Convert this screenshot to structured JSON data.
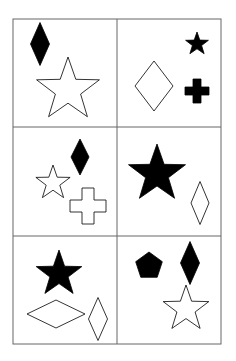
{
  "header": {
    "partial_text": ""
  },
  "grid": {
    "rows": 3,
    "cols": 2,
    "border_color": "#666666",
    "cells": [
      {
        "id": "r1c1",
        "shapes": [
          {
            "type": "diamond",
            "fill": "black",
            "cx": 40,
            "cy": 44,
            "w": 19,
            "h": 43
          },
          {
            "type": "star",
            "fill": "white",
            "cx": 68,
            "cy": 90,
            "r": 33
          }
        ]
      },
      {
        "id": "r1c2",
        "shapes": [
          {
            "type": "star",
            "fill": "black",
            "cx": 197,
            "cy": 44,
            "r": 12
          },
          {
            "type": "diamond",
            "fill": "white",
            "cx": 154,
            "cy": 86,
            "w": 38,
            "h": 50
          },
          {
            "type": "cross",
            "fill": "black",
            "cx": 197,
            "cy": 91,
            "s": 24
          }
        ]
      },
      {
        "id": "r2c1",
        "shapes": [
          {
            "type": "diamond",
            "fill": "black",
            "cx": 80,
            "cy": 157,
            "w": 18,
            "h": 36
          },
          {
            "type": "star",
            "fill": "white",
            "cx": 53,
            "cy": 183,
            "r": 18
          },
          {
            "type": "cross",
            "fill": "white",
            "cx": 88,
            "cy": 206,
            "s": 36
          }
        ]
      },
      {
        "id": "r2c2",
        "shapes": [
          {
            "type": "star",
            "fill": "black",
            "cx": 157,
            "cy": 174,
            "r": 30
          },
          {
            "type": "diamond",
            "fill": "white",
            "cx": 200,
            "cy": 203,
            "w": 18,
            "h": 43
          }
        ]
      },
      {
        "id": "r3c1",
        "shapes": [
          {
            "type": "star",
            "fill": "black",
            "cx": 59,
            "cy": 274,
            "r": 24
          },
          {
            "type": "diamond",
            "fill": "white",
            "cx": 56,
            "cy": 314,
            "w": 58,
            "h": 28
          },
          {
            "type": "diamond",
            "fill": "white",
            "cx": 98,
            "cy": 319,
            "w": 19,
            "h": 43
          }
        ]
      },
      {
        "id": "r3c2",
        "shapes": [
          {
            "type": "pentagon",
            "fill": "black",
            "cx": 149,
            "cy": 266,
            "r": 14
          },
          {
            "type": "diamond",
            "fill": "black",
            "cx": 190,
            "cy": 263,
            "w": 19,
            "h": 43
          },
          {
            "type": "star",
            "fill": "white",
            "cx": 186,
            "cy": 309,
            "r": 24
          }
        ]
      }
    ]
  }
}
